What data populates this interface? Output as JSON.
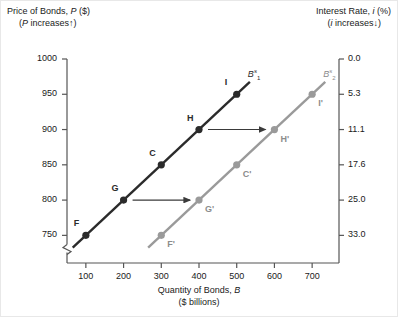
{
  "chart_data": {
    "type": "line",
    "title": "",
    "xlabel": "Quantity of Bonds, B ($ billions)",
    "ylabel": "Price of Bonds, P ($)",
    "y2label": "Interest Rate, i (%)",
    "xlim": [
      50,
      750
    ],
    "ylim": [
      725,
      1000
    ],
    "grid": false,
    "legend": "none",
    "x_ticks": [
      100,
      200,
      300,
      400,
      500,
      600,
      700
    ],
    "y_left_ticks": [
      1000,
      950,
      900,
      850,
      800,
      750
    ],
    "y_right_ticks": [
      "0.0",
      "5.3",
      "11.1",
      "17.6",
      "25.0",
      "33.0"
    ],
    "y_left_axis_break": true,
    "series": [
      {
        "name": "B1s",
        "color": "#2b2b2b",
        "points": [
          {
            "label": "F",
            "x": 100,
            "y": 750
          },
          {
            "label": "G",
            "x": 200,
            "y": 800
          },
          {
            "label": "C",
            "x": 300,
            "y": 850
          },
          {
            "label": "H",
            "x": 400,
            "y": 900
          },
          {
            "label": "I",
            "x": 500,
            "y": 950
          }
        ]
      },
      {
        "name": "B2s",
        "color": "#9a9a9a",
        "points": [
          {
            "label": "F'",
            "x": 300,
            "y": 750
          },
          {
            "label": "G'",
            "x": 400,
            "y": 800
          },
          {
            "label": "C'",
            "x": 500,
            "y": 850
          },
          {
            "label": "H'",
            "x": 600,
            "y": 900
          },
          {
            "label": "I'",
            "x": 700,
            "y": 950
          }
        ]
      }
    ],
    "shift_arrows": [
      {
        "from": "G",
        "to": "G'",
        "x_from": 200,
        "x_to": 400,
        "y": 800
      },
      {
        "from": "H",
        "to": "H'",
        "x_from": 400,
        "x_to": 600,
        "y": 900
      }
    ]
  },
  "labels": {
    "left_axis_line1": "Price of Bonds,  P ($)",
    "left_axis_line2": "(P increases↑)",
    "right_axis_line1": "Interest Rate, i (%)",
    "right_axis_line2": "(i increases↓)",
    "x_axis_line1": "Quantity of Bonds, B",
    "x_axis_line2": "($ billions)",
    "curve1_base": "B",
    "curve1_sup": "s",
    "curve1_sub": "1",
    "curve2_base": "B",
    "curve2_sup": "s",
    "curve2_sub": "2"
  },
  "colors": {
    "curve_dark": "#2b2b2b",
    "curve_light": "#9a9a9a",
    "axis": "#555555",
    "text": "#1a1a1a",
    "background": "#ffffff"
  }
}
